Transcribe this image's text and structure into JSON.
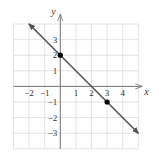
{
  "chart_data": {
    "type": "line",
    "title": "",
    "xlabel": "x",
    "ylabel": "y",
    "xlim": [
      -3,
      5
    ],
    "ylim": [
      -4,
      4
    ],
    "grid": true,
    "x_tick_labels": [
      "-2",
      "-1",
      "1",
      "2",
      "3",
      "4"
    ],
    "x_ticks": [
      -2,
      -1,
      1,
      2,
      3,
      4
    ],
    "y_tick_labels": [
      "3",
      "2",
      "1",
      "-1",
      "-2",
      "-3"
    ],
    "y_ticks": [
      3,
      2,
      1,
      -1,
      -2,
      -3
    ],
    "series": [
      {
        "name": "y = -x + 2",
        "x": [
          -2,
          5
        ],
        "y": [
          4,
          -3
        ],
        "arrows": "both",
        "color": "#555555"
      }
    ],
    "points": [
      {
        "x": 0,
        "y": 2
      },
      {
        "x": 3,
        "y": -1
      }
    ]
  },
  "colors": {
    "grid": "#dddddd",
    "axis": "#777777",
    "line": "#555555",
    "point": "#000000",
    "text": "#333333"
  }
}
